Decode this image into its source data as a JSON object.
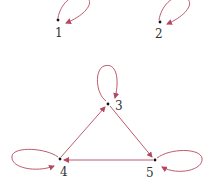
{
  "diagram": {
    "type": "directed-graph",
    "edge_color": "#b5485f",
    "node_color": "#111111",
    "label_color": "#333333",
    "nodes": [
      {
        "id": "1",
        "label": "1",
        "x": 58,
        "y": 20,
        "label_x": 55,
        "label_y": 37
      },
      {
        "id": "2",
        "label": "2",
        "x": 160,
        "y": 22,
        "label_x": 155,
        "label_y": 38
      },
      {
        "id": "3",
        "label": "3",
        "x": 108,
        "y": 104,
        "label_x": 115,
        "label_y": 110
      },
      {
        "id": "4",
        "label": "4",
        "x": 60,
        "y": 159,
        "label_x": 60,
        "label_y": 176
      },
      {
        "id": "5",
        "label": "5",
        "x": 155,
        "y": 160,
        "label_x": 146,
        "label_y": 177
      }
    ],
    "edges": [
      {
        "from": "1",
        "to": "1",
        "kind": "self-loop"
      },
      {
        "from": "2",
        "to": "2",
        "kind": "self-loop"
      },
      {
        "from": "3",
        "to": "3",
        "kind": "self-loop"
      },
      {
        "from": "4",
        "to": "4",
        "kind": "self-loop"
      },
      {
        "from": "5",
        "to": "5",
        "kind": "self-loop"
      },
      {
        "from": "4",
        "to": "3",
        "kind": "edge"
      },
      {
        "from": "3",
        "to": "5",
        "kind": "edge"
      },
      {
        "from": "5",
        "to": "4",
        "kind": "edge"
      }
    ]
  }
}
